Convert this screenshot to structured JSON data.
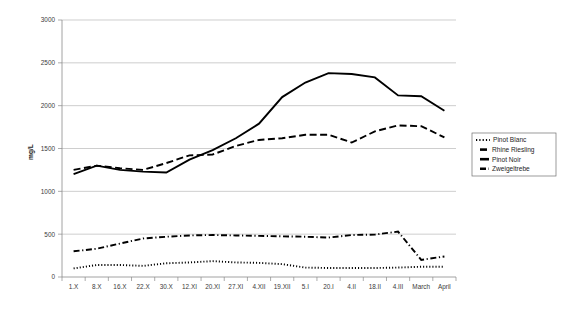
{
  "chart_data": {
    "type": "line",
    "title": "",
    "xlabel": "",
    "ylabel": "mg/L",
    "ylim": [
      0,
      3000
    ],
    "ytick_step": 500,
    "yticks": [
      0,
      500,
      1000,
      1500,
      2000,
      2500,
      3000
    ],
    "grid": true,
    "legend_position": "right-outside",
    "categories": [
      "1.X",
      "8.X",
      "16.X",
      "22.X",
      "30.X",
      "12.XI",
      "20.XI",
      "27.XI",
      "4.XII",
      "19.XII",
      "5.I",
      "20.I",
      "4.II",
      "18.II",
      "4.III",
      "March",
      "April"
    ],
    "series": [
      {
        "name": "Pinot Blanc",
        "style": "dotted",
        "values": [
          100,
          140,
          140,
          130,
          160,
          170,
          185,
          170,
          165,
          150,
          110,
          105,
          105,
          105,
          110,
          120,
          120
        ]
      },
      {
        "name": "Rhine Riesling",
        "style": "dashed",
        "values": [
          1250,
          1300,
          1270,
          1250,
          1330,
          1420,
          1430,
          1530,
          1600,
          1620,
          1660,
          1660,
          1570,
          1700,
          1770,
          1760,
          1630
        ]
      },
      {
        "name": "Pinot Noir",
        "style": "solid",
        "values": [
          1200,
          1300,
          1250,
          1230,
          1220,
          1370,
          1480,
          1620,
          1790,
          2100,
          2270,
          2380,
          2370,
          2330,
          2120,
          2110,
          1940
        ]
      },
      {
        "name": "Zweigeltrebe",
        "style": "dash-dot",
        "values": [
          300,
          330,
          390,
          450,
          470,
          485,
          490,
          485,
          480,
          475,
          470,
          460,
          490,
          495,
          530,
          200,
          240
        ]
      }
    ]
  },
  "legend": {
    "entries": [
      {
        "label": "Pinot Blanc"
      },
      {
        "label": "Rhine Riesling"
      },
      {
        "label": "Pinot Noir"
      },
      {
        "label": "Zweigeltrebe"
      }
    ]
  },
  "axes": {
    "ylabel": "mg/L",
    "ytick_labels": [
      "3000",
      "2500",
      "2000",
      "1500",
      "1000",
      "500",
      "0"
    ],
    "xtick_labels": [
      "1.X",
      "8.X",
      "16.X",
      "22.X",
      "30.X",
      "12.XI",
      "20.XI",
      "27.XI",
      "4.XII",
      "19.XII",
      "5.I",
      "20.I",
      "4.II",
      "18.II",
      "4.III",
      "March",
      "April"
    ]
  }
}
